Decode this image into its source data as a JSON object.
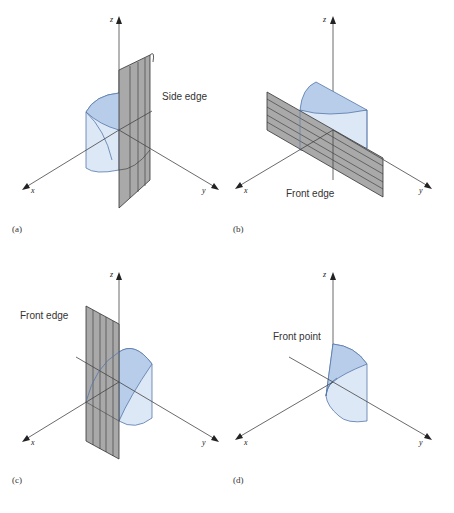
{
  "figure": {
    "panels": [
      {
        "id": "a",
        "caption": "(a)",
        "annotation": "Side edge",
        "axes": {
          "x": "x",
          "y": "y",
          "z": "z"
        }
      },
      {
        "id": "b",
        "caption": "(b)",
        "annotation": "Front edge",
        "axes": {
          "x": "x",
          "y": "y",
          "z": "z"
        }
      },
      {
        "id": "c",
        "caption": "(c)",
        "annotation": "Front edge",
        "axes": {
          "x": "x",
          "y": "y",
          "z": "z"
        }
      },
      {
        "id": "d",
        "caption": "(d)",
        "annotation": "Front point",
        "axes": {
          "x": "x",
          "y": "y",
          "z": "z"
        }
      }
    ],
    "colors": {
      "solid_fill_light": "#dce8f6",
      "solid_fill_dark": "#b8cde9",
      "solid_stroke": "#5577aa",
      "plane_fill": "#a9a9a9",
      "plane_stroke": "#333333",
      "axis": "#444444"
    }
  }
}
